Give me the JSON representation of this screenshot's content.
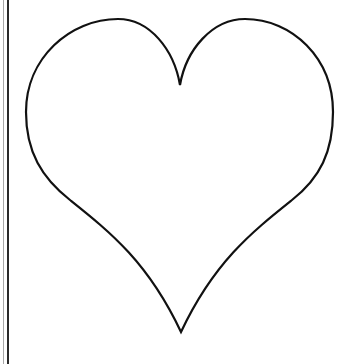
{
  "image": {
    "description": "Heart outline drawing",
    "shape": "heart-outline",
    "stroke_color": "#111111",
    "fill_color": "#ffffff",
    "background_color": "#ffffff",
    "left_border": {
      "light_color": "#a8a8a8",
      "dark_color": "#2a2a2a"
    }
  }
}
